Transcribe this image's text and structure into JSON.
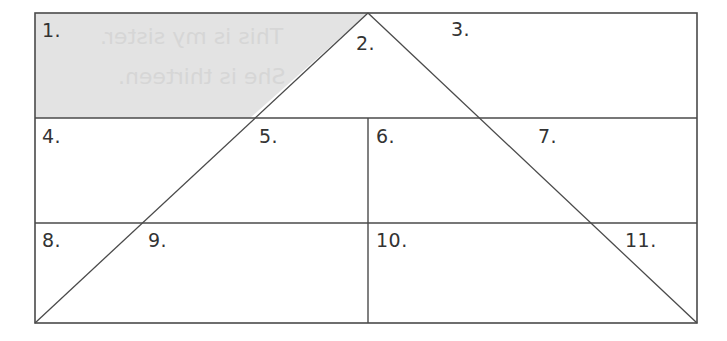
{
  "diagram": {
    "colors": {
      "line": "#4a4a4a",
      "shade": "#e3e3e3",
      "background": "#ffffff",
      "label": "#333333",
      "ghost_text": "#d6d6d6"
    },
    "labels": {
      "l1": "1.",
      "l2": "2.",
      "l3": "3.",
      "l4": "4.",
      "l5": "5.",
      "l6": "6.",
      "l7": "7.",
      "l8": "8.",
      "l9": "9.",
      "l10": "10.",
      "l11": "11."
    },
    "ghost_text": {
      "line1": "This is my sister.",
      "line2": "She is thirteen."
    }
  }
}
